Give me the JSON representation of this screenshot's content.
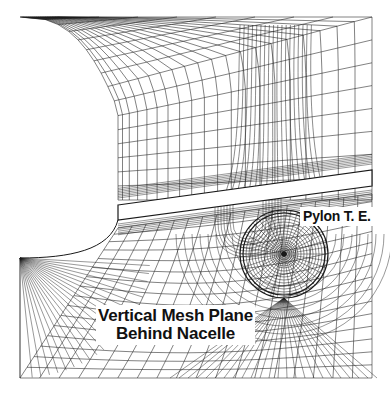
{
  "figure": {
    "type": "structured CFD grid, vertical mesh plane",
    "line_color": "#1a1a1a",
    "background": "#ffffff"
  },
  "labels": {
    "pylon": "Pylon T. E.",
    "plane_line1": "Vertical Mesh Plane",
    "plane_line2": "Behind Nacelle"
  }
}
